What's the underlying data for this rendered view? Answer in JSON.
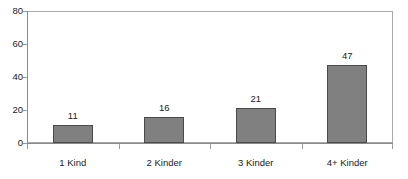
{
  "chart_data": {
    "type": "bar",
    "title": "",
    "xlabel": "",
    "ylabel": "",
    "categories": [
      "1 Kind",
      "2 Kinder",
      "3 Kinder",
      "4+ Kinder"
    ],
    "values": [
      11,
      16,
      21,
      47
    ],
    "data_labels": [
      "11",
      "16",
      "21",
      "47"
    ],
    "ylim": [
      0,
      80
    ],
    "yticks": [
      0,
      20,
      40,
      60,
      80
    ],
    "ytick_labels": [
      "0",
      "20",
      "40",
      "60",
      "80"
    ],
    "grid": false,
    "legend": null,
    "bar_color": "#808080",
    "bar_border_color": "#4a4a4a",
    "frame_color": "#a8a8a8",
    "background": "#ffffff"
  }
}
